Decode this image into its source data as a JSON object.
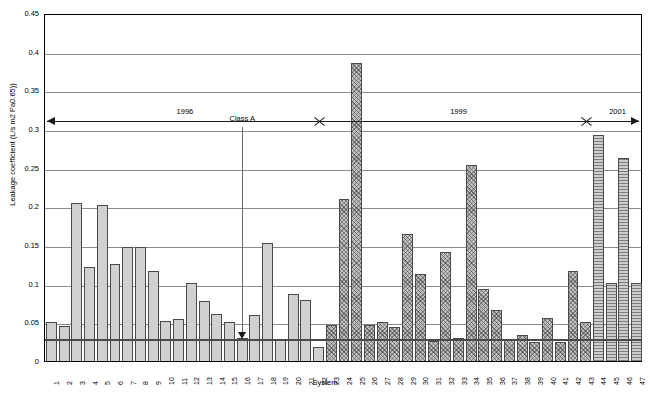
{
  "chart_data": {
    "type": "bar",
    "title": "",
    "xlabel": "System",
    "ylabel": "Leakage coefficient (L/s m2 Pa0.65))",
    "ylim": [
      0,
      0.45
    ],
    "ytick_step": 0.05,
    "yticks": [
      "0",
      "0.05",
      "0.1",
      "0.15",
      "0.2",
      "0.25",
      "0.3",
      "0.35",
      "0.4",
      "0.45"
    ],
    "grid": true,
    "legend": "none",
    "categories": [
      "1",
      "2",
      "3",
      "4",
      "5",
      "6",
      "7",
      "8",
      "9",
      "10",
      "11",
      "12",
      "13",
      "14",
      "15",
      "16",
      "17",
      "18",
      "19",
      "20",
      "21",
      "22",
      "23",
      "24",
      "25",
      "26",
      "27",
      "28",
      "29",
      "30",
      "31",
      "32",
      "33",
      "34",
      "35",
      "36",
      "37",
      "38",
      "39",
      "40",
      "41",
      "42",
      "43",
      "44",
      "45",
      "46",
      "47"
    ],
    "values": [
      0.051,
      0.045,
      0.204,
      0.122,
      0.202,
      0.126,
      0.147,
      0.148,
      0.116,
      0.052,
      0.054,
      0.101,
      0.077,
      0.061,
      0.05,
      0.03,
      0.06,
      0.152,
      0.029,
      0.087,
      0.079,
      0.018,
      0.047,
      0.209,
      0.386,
      0.046,
      0.051,
      0.044,
      0.164,
      0.112,
      0.026,
      0.141,
      0.03,
      0.253,
      0.093,
      0.066,
      0.028,
      0.034,
      0.025,
      0.055,
      0.025,
      0.117,
      0.05,
      0.292,
      0.101,
      0.262,
      0.101
    ],
    "bar_patterns": [
      "solid",
      "solid",
      "solid",
      "solid",
      "solid",
      "solid",
      "solid",
      "solid",
      "solid",
      "solid",
      "solid",
      "solid",
      "solid",
      "solid",
      "solid",
      "solid",
      "solid",
      "solid",
      "solid",
      "solid",
      "solid",
      "solid",
      "cross",
      "cross",
      "cross",
      "cross",
      "cross",
      "cross",
      "cross",
      "cross",
      "cross",
      "cross",
      "cross",
      "cross",
      "cross",
      "cross",
      "cross",
      "cross",
      "cross",
      "cross",
      "cross",
      "cross",
      "cross",
      "horiz",
      "horiz",
      "horiz",
      "horiz"
    ],
    "threshold": {
      "label": "Class A",
      "value": 0.03,
      "marker_category": "16"
    },
    "period_annotation": {
      "label_1": "1996",
      "label_2": "1999",
      "label_3": "2001",
      "break_1_after_category": "22",
      "break_2_after_category": "43"
    }
  },
  "colors": {
    "bar_fill": "#d0d0d0",
    "bar_stroke": "#4a4a4a",
    "gridline": "#8a8a8a",
    "axis": "#000000",
    "threshold": "#4a4a4a"
  }
}
